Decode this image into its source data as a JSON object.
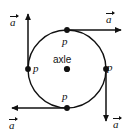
{
  "figure": {
    "background_color": "#ffffff",
    "ink_color": "#111111"
  },
  "circle": {
    "center_x": 67,
    "center_y": 69,
    "radius": 39,
    "stroke_color": "#111111",
    "stroke_width": 1.4
  },
  "center_point": {
    "label": "axle",
    "x": 67,
    "y": 69
  },
  "points": [
    {
      "name": "point-top",
      "label": "p",
      "x": 67,
      "y": 30
    },
    {
      "name": "point-right",
      "label": "p",
      "x": 106,
      "y": 69
    },
    {
      "name": "point-bottom",
      "label": "p",
      "x": 67,
      "y": 108
    },
    {
      "name": "point-left",
      "label": "p",
      "x": 28,
      "y": 69
    }
  ],
  "vectors": [
    {
      "name": "acceleration-top",
      "label": "a",
      "direction": "right",
      "from_x": 67,
      "from_y": 30,
      "to_x": 124,
      "to_y": 30,
      "label_position": "above-tip"
    },
    {
      "name": "acceleration-right",
      "label": "a",
      "direction": "down",
      "from_x": 106,
      "from_y": 69,
      "to_x": 106,
      "to_y": 124,
      "label_position": "right-of-tip"
    },
    {
      "name": "acceleration-bottom",
      "label": "a",
      "direction": "left",
      "from_x": 67,
      "from_y": 108,
      "to_x": 9,
      "to_y": 108,
      "label_position": "below-tip"
    },
    {
      "name": "acceleration-left",
      "label": "a",
      "direction": "up",
      "from_x": 28,
      "from_y": 69,
      "to_x": 28,
      "to_y": 11,
      "label_position": "left-of-tip"
    }
  ],
  "labels": {
    "point_label": "p",
    "axle_label": "axle",
    "vector_label": "a"
  }
}
